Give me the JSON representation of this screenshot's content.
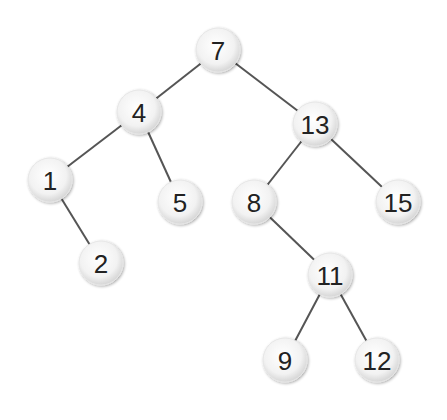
{
  "diagram": {
    "type": "binary-search-tree",
    "colors": {
      "edge": "#555555",
      "node_fill_center": "#ffffff",
      "node_fill_edge": "#d9d9d9",
      "label": "#222222"
    },
    "node_radius": 22,
    "nodes": [
      {
        "id": "n7",
        "label": "7",
        "x": 218,
        "y": 50
      },
      {
        "id": "n4",
        "label": "4",
        "x": 139,
        "y": 112
      },
      {
        "id": "n13",
        "label": "13",
        "x": 315,
        "y": 124
      },
      {
        "id": "n1",
        "label": "1",
        "x": 50,
        "y": 180
      },
      {
        "id": "n5",
        "label": "5",
        "x": 180,
        "y": 202
      },
      {
        "id": "n8",
        "label": "8",
        "x": 254,
        "y": 202
      },
      {
        "id": "n15",
        "label": "15",
        "x": 398,
        "y": 202
      },
      {
        "id": "n2",
        "label": "2",
        "x": 101,
        "y": 263
      },
      {
        "id": "n11",
        "label": "11",
        "x": 330,
        "y": 275
      },
      {
        "id": "n9",
        "label": "9",
        "x": 285,
        "y": 360
      },
      {
        "id": "n12",
        "label": "12",
        "x": 377,
        "y": 360
      }
    ],
    "edges": [
      {
        "from": "n7",
        "to": "n4"
      },
      {
        "from": "n7",
        "to": "n13"
      },
      {
        "from": "n4",
        "to": "n1"
      },
      {
        "from": "n4",
        "to": "n5"
      },
      {
        "from": "n1",
        "to": "n2"
      },
      {
        "from": "n13",
        "to": "n8"
      },
      {
        "from": "n13",
        "to": "n15"
      },
      {
        "from": "n8",
        "to": "n11"
      },
      {
        "from": "n11",
        "to": "n9"
      },
      {
        "from": "n11",
        "to": "n12"
      }
    ]
  }
}
